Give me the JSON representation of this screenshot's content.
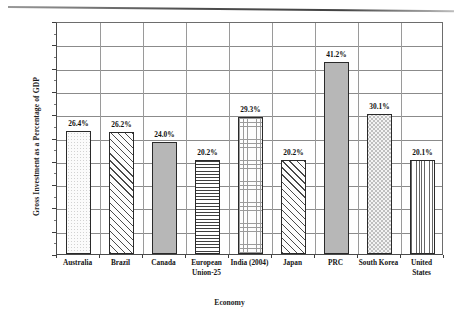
{
  "chart_data": {
    "type": "bar",
    "title": "",
    "xlabel": "Economy",
    "ylabel": "Gross Investment as a Percentage of GDP",
    "categories": [
      "Australia",
      "Brazil",
      "Canada",
      "European Union-25",
      "India (2004)",
      "Japan",
      "PRC",
      "South Korea",
      "United States"
    ],
    "category_lines": [
      [
        "Australia"
      ],
      [
        "Brazil"
      ],
      [
        "Canada"
      ],
      [
        "European",
        "Union-25"
      ],
      [
        "India (2004)"
      ],
      [
        "Japan"
      ],
      [
        "PRC"
      ],
      [
        "South Korea"
      ],
      [
        "United",
        "States"
      ]
    ],
    "values": [
      26.4,
      26.2,
      24.0,
      20.2,
      29.3,
      20.2,
      41.2,
      30.1,
      20.1
    ],
    "value_labels": [
      "26.4%",
      "26.2%",
      "24.0%",
      "20.2%",
      "29.3%",
      "20.2%",
      "41.2%",
      "30.1%",
      "20.1%"
    ],
    "bar_patterns": [
      "dots-light",
      "diagonal-hatch",
      "solid-gray",
      "horizontal-lines",
      "crosshatch-grid",
      "diagonal-hatch",
      "solid-gray",
      "checker-dots",
      "vertical-lines"
    ],
    "ylim": [
      0,
      50
    ],
    "ytick_labels": [
      "0%",
      "5%",
      "10%",
      "15%",
      "20%",
      "25%",
      "30%",
      "35%",
      "40%",
      "45%",
      "50%"
    ],
    "ytick_values": [
      0,
      5,
      10,
      15,
      20,
      25,
      30,
      35,
      40,
      45,
      50
    ],
    "grid": true,
    "legend": "none",
    "colors": {
      "plot_background": "#ffffff",
      "gridline": "#8b8b8b",
      "axis": "#3c3c3c",
      "bar_outline": "#2a2a2a",
      "solid_fill": "#b7b7b7",
      "text": "#141414"
    }
  }
}
